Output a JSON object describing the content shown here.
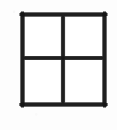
{
  "figure": {
    "name": "quadrant-grid",
    "type": "diagram",
    "caption": "",
    "canvas": {
      "width": 117,
      "height": 130
    },
    "colors": {
      "background": "#fdfdfd",
      "stroke": "#1f1f1f",
      "stroke_soft": "#4a4a4a",
      "fill": "#ffffff"
    },
    "geometry": {
      "outer_square": {
        "x": 21,
        "y": 13,
        "width": 85,
        "height": 93
      },
      "stroke_width": 3,
      "divider_vertical_x": 63,
      "divider_horizontal_y": 58,
      "rows": 2,
      "columns": 2,
      "cell_count": 4
    },
    "cells": [
      {
        "id": "top-left",
        "label": "",
        "row": 1,
        "column": 1
      },
      {
        "id": "top-right",
        "label": "",
        "row": 1,
        "column": 2
      },
      {
        "id": "bottom-left",
        "label": "",
        "row": 2,
        "column": 1
      },
      {
        "id": "bottom-right",
        "label": "",
        "row": 2,
        "column": 2
      }
    ],
    "lines": [
      {
        "id": "outer-top",
        "orientation": "horizontal"
      },
      {
        "id": "outer-right",
        "orientation": "vertical"
      },
      {
        "id": "outer-bottom",
        "orientation": "horizontal"
      },
      {
        "id": "outer-left",
        "orientation": "vertical"
      },
      {
        "id": "divider-vertical",
        "orientation": "vertical"
      },
      {
        "id": "divider-horizontal",
        "orientation": "horizontal"
      }
    ]
  }
}
